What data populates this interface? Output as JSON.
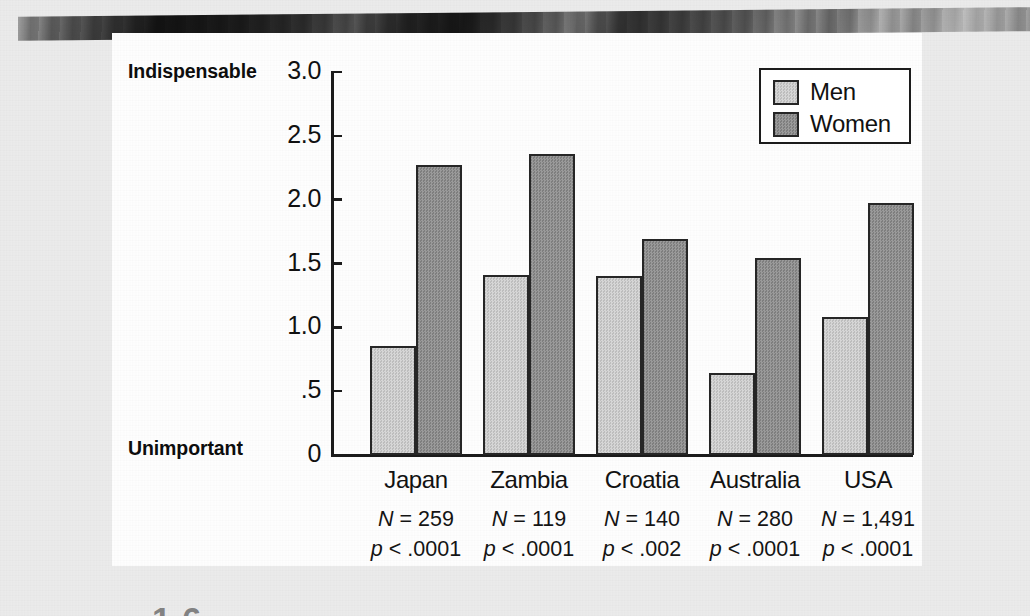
{
  "chart_data": {
    "type": "bar",
    "title": "",
    "subtitle": "",
    "xlabel": "",
    "ylabel": "",
    "ylim": [
      0,
      3.0
    ],
    "yticks": [
      "0",
      ".5",
      "1.0",
      "1.5",
      "2.0",
      "2.5",
      "3.0"
    ],
    "ytick_values": [
      0,
      0.5,
      1.0,
      1.5,
      2.0,
      2.5,
      3.0
    ],
    "y_axis_high_label": "Indispensable",
    "y_axis_low_label": "Unimportant",
    "grid": false,
    "legend_position": "top-right",
    "categories": [
      "Japan",
      "Zambia",
      "Croatia",
      "Australia",
      "USA"
    ],
    "series": [
      {
        "name": "Men",
        "color": "#c9c9c9",
        "values": [
          0.85,
          1.41,
          1.4,
          0.64,
          1.08
        ]
      },
      {
        "name": "Women",
        "color": "#8c8c8c",
        "values": [
          2.27,
          2.36,
          1.69,
          1.54,
          1.97
        ]
      }
    ],
    "annotations": [
      {
        "n": "N = 259",
        "p": "p < .0001"
      },
      {
        "n": "N = 119",
        "p": "p < .0001"
      },
      {
        "n": "N = 140",
        "p": "p < .002"
      },
      {
        "n": "N = 280",
        "p": "p < .0001"
      },
      {
        "n": "N = 1,491",
        "p": "p < .0001"
      }
    ]
  },
  "annotation_parts": [
    {
      "n_prefix": "N",
      "n_rest": " = 259",
      "p_prefix": "p",
      "p_rest": " < .0001"
    },
    {
      "n_prefix": "N",
      "n_rest": " = 119",
      "p_prefix": "p",
      "p_rest": " < .0001"
    },
    {
      "n_prefix": "N",
      "n_rest": " = 140",
      "p_prefix": "p",
      "p_rest": " < .002"
    },
    {
      "n_prefix": "N",
      "n_rest": " = 280",
      "p_prefix": "p",
      "p_rest": " < .0001"
    },
    {
      "n_prefix": "N",
      "n_rest": " = 1,491",
      "p_prefix": "p",
      "p_rest": " < .0001"
    }
  ],
  "legend": {
    "items": [
      {
        "label": "Men",
        "color": "#c9c9c9"
      },
      {
        "label": "Women",
        "color": "#8c8c8c"
      }
    ]
  },
  "page": {
    "background_color": "#ececec",
    "panel_color": "#ffffff",
    "ink_color": "#1b1b1b"
  }
}
